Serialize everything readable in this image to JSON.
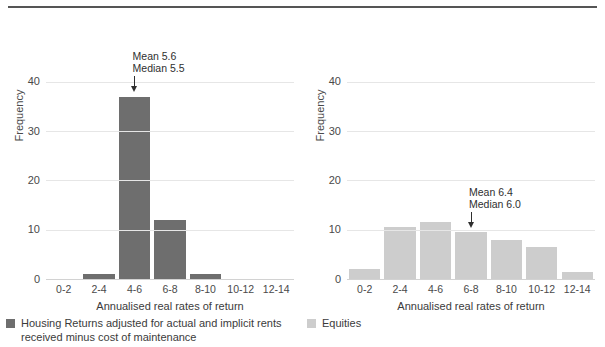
{
  "figure": {
    "caption_cropped": "",
    "axis_label": "Annualised real rates of return",
    "ylabel": "Frequency"
  },
  "colors": {
    "housing_bar": "#6e6e6e",
    "equities_bar": "#cdcdcd",
    "grid": "#e6e6e6",
    "axis": "#d2d2d2",
    "text": "#3b3b3b",
    "rule": "#555555"
  },
  "legend": {
    "items": [
      {
        "key": "housing",
        "label": "Housing Returns adjusted for actual and implicit rents\nreceived minus cost of maintenance",
        "color": "#6e6e6e"
      },
      {
        "key": "equities",
        "label": "Equities",
        "color": "#cdcdcd"
      }
    ]
  },
  "chart_data": [
    {
      "type": "bar",
      "panel": "left",
      "title": "",
      "series_name": "Housing Returns adjusted for actual and implicit rents received minus cost of maintenance",
      "categories": [
        "0-2",
        "2-4",
        "4-6",
        "6-8",
        "8-10",
        "10-12",
        "12-14"
      ],
      "values": [
        0,
        1,
        37,
        12,
        1,
        0,
        0
      ],
      "xlabel": "Annualised real rates of return",
      "ylabel": "Frequency",
      "yticks": [
        0,
        10,
        20,
        30,
        40
      ],
      "ylim": [
        0,
        44.8
      ],
      "grid": true,
      "color": "#6e6e6e",
      "annotation": {
        "line1": "Mean 5.6",
        "line2": "Median 5.5",
        "mean": 5.6,
        "median": 5.5,
        "points_to_category": "4-6"
      }
    },
    {
      "type": "bar",
      "panel": "right",
      "title": "",
      "series_name": "Equities",
      "categories": [
        "0-2",
        "2-4",
        "4-6",
        "6-8",
        "8-10",
        "10-12",
        "12-14"
      ],
      "values": [
        2,
        10.5,
        11.5,
        9.5,
        8,
        6.5,
        1.5
      ],
      "xlabel": "Annualised real rates of return",
      "ylabel": "Frequency",
      "yticks": [
        0,
        10,
        20,
        30,
        40
      ],
      "ylim": [
        0,
        44.8
      ],
      "grid": true,
      "color": "#cdcdcd",
      "annotation": {
        "line1": "Mean 6.4",
        "line2": "Median 6.0",
        "mean": 6.4,
        "median": 6.0,
        "points_to_category": "6-8"
      }
    }
  ]
}
